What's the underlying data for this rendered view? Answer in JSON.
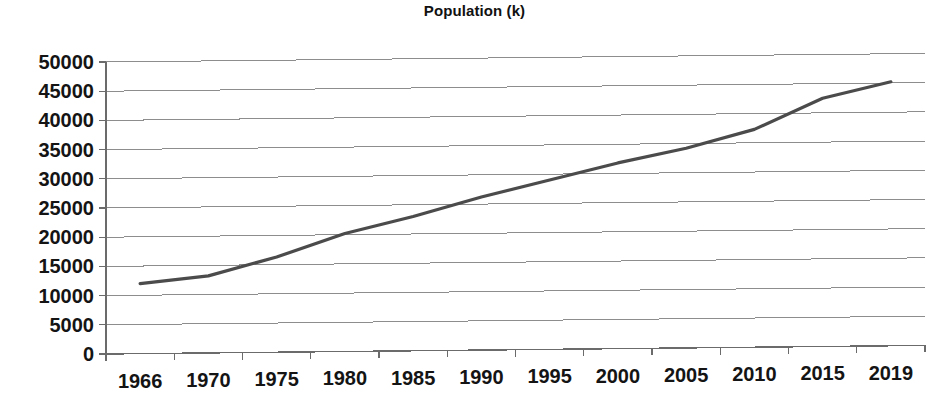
{
  "chart_data": {
    "type": "line",
    "title": "Population (k)",
    "xlabel": "",
    "ylabel": "",
    "categories": [
      "1966",
      "1970",
      "1975",
      "1980",
      "1985",
      "1990",
      "1995",
      "2000",
      "2005",
      "2010",
      "2015",
      "2019"
    ],
    "series": [
      {
        "name": "Population (k)",
        "color": "#4b4b4b",
        "values": [
          12000,
          13200,
          16300,
          20200,
          23000,
          26200,
          29000,
          31800,
          34200,
          37300,
          42500,
          45200
        ]
      }
    ],
    "ylim": [
      0,
      50000
    ],
    "yticks": [
      0,
      5000,
      10000,
      15000,
      20000,
      25000,
      30000,
      35000,
      40000,
      45000,
      50000
    ],
    "ytick_labels": [
      "0",
      "5000",
      "10000",
      "15000",
      "20000",
      "25000",
      "30000",
      "35000",
      "40000",
      "45000",
      "50000"
    ],
    "grid": true,
    "grid_axis": "y",
    "legend": false,
    "legend_position": "none",
    "marker": "none",
    "background": "#ffffff",
    "gridline_color": "#8d8d8d",
    "axis_color": "#6b6b6b",
    "text_color": "#141414"
  },
  "layout": {
    "plot_left": 106,
    "plot_right": 925,
    "plot_top": 62,
    "plot_bottom": 354,
    "tilt_degrees": -0.6,
    "ylabel_right": 94,
    "xlabel_baseline": 388,
    "tick_length": 7
  }
}
